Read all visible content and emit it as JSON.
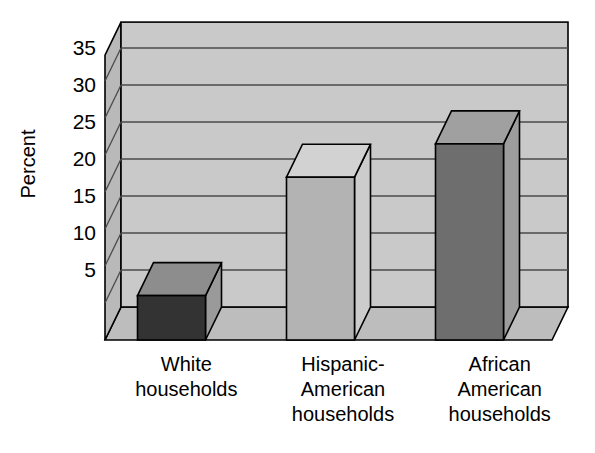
{
  "chart_data": {
    "type": "bar",
    "title": "",
    "subtitle": "",
    "xlabel": "",
    "ylabel": "Percent",
    "categories": [
      "White households",
      "Hispanic-American households",
      "African American households"
    ],
    "category_lines": [
      [
        "White",
        "households"
      ],
      [
        "Hispanic-",
        "American",
        "households"
      ],
      [
        "African",
        "American",
        "households"
      ]
    ],
    "values": [
      6,
      22,
      26.5
    ],
    "back_top_values": [
      8.7,
      25,
      29.5
    ],
    "ylim": [
      0,
      38.5
    ],
    "yticks": [
      5,
      10,
      15,
      20,
      25,
      30,
      35
    ],
    "ytick_labels": [
      "5",
      "10",
      "15",
      "20",
      "25",
      "30",
      "35"
    ],
    "grid": true,
    "grid_axis": "y",
    "legend": false,
    "legend_position": "none",
    "style": "3d-bars",
    "bar_colors": [
      "#333333",
      "#b3b3b3",
      "#6e6e6e"
    ],
    "bar_top_colors": [
      "#8d8d8d",
      "#d2d2d2",
      "#a0a0a0"
    ],
    "bar_side_colors": [
      "#9a9a9a",
      "#cccccc",
      "#9d9d9d"
    ],
    "plot_background": "#c9c9c9",
    "plot_wall_side": "#b9b9b9",
    "plot_floor": "#bdbdbd",
    "axis_color": "#000000",
    "grid_color": "#4a4a4a",
    "text_color": "#000000"
  },
  "chart": {
    "ylabel": "Percent"
  }
}
